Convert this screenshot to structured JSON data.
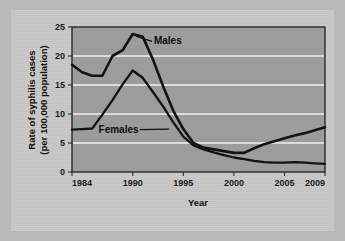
{
  "chart_data": {
    "type": "line",
    "title": "",
    "xlabel": "Year",
    "ylabel": "Rate of syphilis cases (per 100,000 population)",
    "ylabel_line1": "Rate of syphilis cases",
    "ylabel_line2": "(per 100,000 population)",
    "xlim": [
      1984,
      2009
    ],
    "ylim": [
      0,
      25
    ],
    "yticks": [
      0,
      5,
      10,
      15,
      20,
      25
    ],
    "ytick_labels": [
      "0",
      "5",
      "10",
      "15",
      "20",
      "25"
    ],
    "xticks": [
      1984,
      1990,
      1995,
      2000,
      2005,
      2009
    ],
    "xtick_labels": [
      "1984",
      "1990",
      "1995",
      "2000",
      "2005",
      "2009"
    ],
    "grid": "horizontal",
    "grid_color": "#f2f2f0",
    "plot_background": "#9c9c9a",
    "line_color": "#131313",
    "legend_position": "inline-annotations",
    "x": [
      1984,
      1985,
      1986,
      1987,
      1988,
      1989,
      1990,
      1991,
      1992,
      1993,
      1994,
      1995,
      1996,
      1997,
      1998,
      1999,
      2000,
      2001,
      2002,
      2003,
      2004,
      2005,
      2006,
      2007,
      2008,
      2009
    ],
    "series": [
      {
        "name": "Males",
        "label": "Males",
        "values": [
          18.5,
          17.2,
          16.6,
          16.6,
          20.0,
          21.0,
          23.8,
          23.3,
          19.4,
          14.8,
          10.6,
          7.4,
          5.0,
          4.2,
          3.9,
          3.6,
          3.3,
          3.3,
          4.1,
          4.8,
          5.3,
          5.8,
          6.3,
          6.7,
          7.2,
          7.7
        ]
      },
      {
        "name": "Females",
        "label": "Females",
        "values": [
          7.3,
          7.4,
          7.5,
          9.9,
          12.4,
          15.1,
          17.5,
          16.2,
          13.8,
          11.3,
          8.6,
          6.1,
          4.6,
          3.9,
          3.4,
          2.9,
          2.5,
          2.2,
          1.9,
          1.7,
          1.6,
          1.6,
          1.7,
          1.6,
          1.5,
          1.4
        ]
      }
    ],
    "annotations": [
      {
        "text": "Males",
        "x": 1991.6,
        "y": 22.6,
        "leader_to_x": 1990.3,
        "leader_to_y": 23.4
      },
      {
        "text": "Females",
        "x": 1988.6,
        "y": 7.4,
        "leader_to_x": 1993.6,
        "leader_to_y": 7.4
      }
    ]
  },
  "figure": {
    "background_color": "#b9b9b7",
    "card_color": "#c8c8c6"
  }
}
